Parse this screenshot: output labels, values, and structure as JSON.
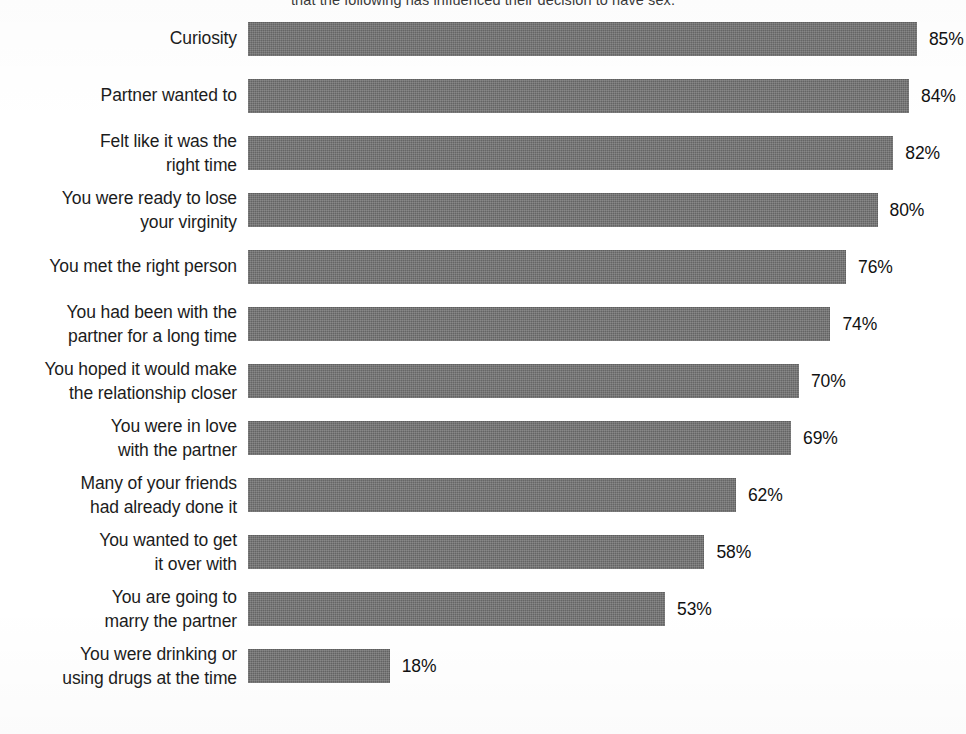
{
  "chart_data": {
    "type": "bar",
    "orientation": "horizontal",
    "title": "that the following has influenced their decision to have sex.",
    "title_clipped": true,
    "xlabel": "",
    "ylabel": "",
    "xlim": [
      0,
      100
    ],
    "grid": false,
    "legend": false,
    "value_suffix": "%",
    "bar_color": "#6f6f6f",
    "background_color": "#ffffff",
    "text_color": "#1c1c1c",
    "categories": [
      "Curiosity",
      "Partner wanted to",
      "Felt like it was the\nright time",
      "You were ready to lose\nyour virginity",
      "You met the right person",
      "You had been with the\npartner for a long time",
      "You hoped it would make\nthe relationship closer",
      "You were in love\nwith the partner",
      "Many of your friends\nhad already done it",
      "You wanted to get\nit over with",
      "You are going to\nmarry the partner",
      "You were drinking or\nusing drugs at the time"
    ],
    "values": [
      85,
      84,
      82,
      80,
      76,
      74,
      70,
      69,
      62,
      58,
      53,
      18
    ],
    "value_labels": [
      "85%",
      "84%",
      "82%",
      "80%",
      "76%",
      "74%",
      "70%",
      "69%",
      "62%",
      "58%",
      "53%",
      "18%"
    ]
  }
}
